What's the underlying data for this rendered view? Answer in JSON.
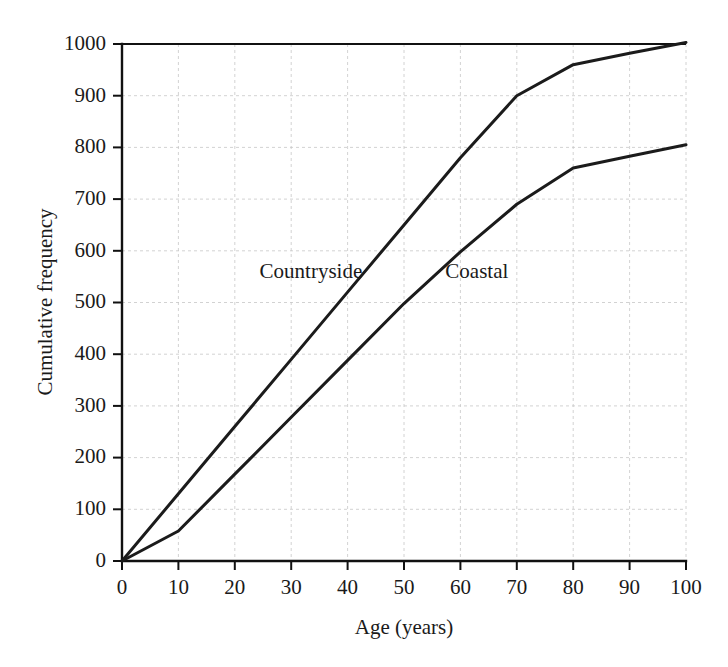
{
  "chart_data": {
    "type": "line",
    "title": "",
    "subtitle": "",
    "xlabel": "Age (years)",
    "ylabel": "Cumulative frequency",
    "xlim": [
      0,
      100
    ],
    "ylim": [
      0,
      1000
    ],
    "xticks": [
      0,
      10,
      20,
      30,
      40,
      50,
      60,
      70,
      80,
      90,
      100
    ],
    "yticks": [
      0,
      100,
      200,
      300,
      400,
      500,
      600,
      700,
      800,
      900,
      1000
    ],
    "xtick_labels": [
      "0",
      "10",
      "20",
      "30",
      "40",
      "50",
      "60",
      "70",
      "80",
      "90",
      "100"
    ],
    "ytick_labels": [
      "0",
      "100",
      "200",
      "300",
      "400",
      "500",
      "600",
      "700",
      "800",
      "900",
      "1000"
    ],
    "grid": true,
    "legend_position": "inline-annotation",
    "series": [
      {
        "name": "Countryside",
        "color": "#1b1b1b",
        "label_x": 40,
        "label_y": 560,
        "x": [
          0,
          10,
          20,
          30,
          40,
          50,
          60,
          70,
          80,
          90,
          100
        ],
        "values": [
          0,
          130,
          260,
          390,
          520,
          650,
          780,
          900,
          960,
          982,
          1003
        ]
      },
      {
        "name": "Coastal",
        "color": "#1b1b1b",
        "label_x": 63,
        "label_y": 560,
        "x": [
          0,
          10,
          20,
          30,
          40,
          50,
          60,
          70,
          80,
          90,
          100
        ],
        "values": [
          0,
          58,
          168,
          278,
          388,
          498,
          598,
          690,
          760,
          783,
          805
        ]
      }
    ],
    "annotations": [
      {
        "text": "Countryside",
        "x": 40,
        "y": 560
      },
      {
        "text": "Coastal",
        "x": 63,
        "y": 560
      }
    ]
  },
  "axis": {
    "x_title": "Age (years)",
    "y_title": "Cumulative frequency"
  },
  "labels": {
    "countryside": "Countryside",
    "coastal": "Coastal"
  },
  "ticks": {
    "y": [
      "1000",
      "900",
      "800",
      "700",
      "600",
      "500",
      "400",
      "300",
      "200",
      "100",
      "0"
    ],
    "x": [
      "0",
      "10",
      "20",
      "30",
      "40",
      "50",
      "60",
      "70",
      "80",
      "90",
      "100"
    ]
  },
  "colors": {
    "line": "#1b1b1b",
    "axis": "#111111",
    "grid": "#c7c7c7",
    "background": "#ffffff"
  }
}
